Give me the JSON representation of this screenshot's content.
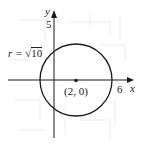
{
  "figure": {
    "type": "circle-on-axes",
    "axes": {
      "x_label": "x",
      "y_label": "y",
      "x_tick_label": "6",
      "y_tick_label": "5"
    },
    "circle": {
      "center_label": "(2, 0)",
      "center": [
        2,
        0
      ],
      "radius_label_prefix": "r = ",
      "radius_sqrt_symbol": "√",
      "radius_radicand": "10",
      "radius_value": 3.1623
    },
    "colors": {
      "stroke": "#1a1a1a",
      "background": "#ffffff",
      "faint_grid": "#ececec"
    }
  }
}
